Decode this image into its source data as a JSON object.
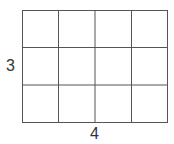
{
  "diagram": {
    "type": "rectangle-grid",
    "rows": 3,
    "columns": 4,
    "labels": {
      "height": "3",
      "width": "4"
    },
    "colors": {
      "line": "#555555",
      "fill": "#ffffff",
      "text": "#333333"
    }
  }
}
